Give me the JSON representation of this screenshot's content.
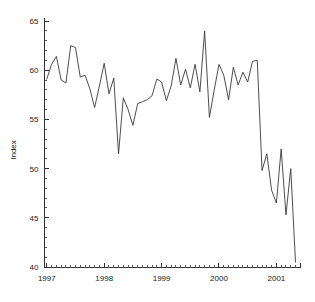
{
  "chart_data": {
    "type": "line",
    "title": "",
    "subtitle": "",
    "xlabel": "",
    "ylabel": "Index",
    "ylim": [
      40,
      65
    ],
    "xlim": [
      1996.96,
      2001.42
    ],
    "y_ticks": [
      40,
      45,
      50,
      55,
      60,
      65
    ],
    "y_tick_labels": [
      "40",
      "45",
      "50",
      "55",
      "60",
      "65"
    ],
    "y_minor_step": 1,
    "x_ticks": [
      1997,
      1998,
      1999,
      2000,
      2001
    ],
    "x_tick_labels": [
      "1997",
      "1998",
      "1999",
      "2000",
      "2001"
    ],
    "x_minor_step": 0.0833333,
    "grid": false,
    "legend": "none",
    "line_color": "#3a3a3a",
    "series": [
      {
        "name": "Index",
        "x": [
          1997.0,
          1997.083,
          1997.167,
          1997.25,
          1997.333,
          1997.417,
          1997.5,
          1997.583,
          1997.667,
          1997.75,
          1997.833,
          1997.917,
          1998.0,
          1998.083,
          1998.167,
          1998.25,
          1998.333,
          1998.417,
          1998.5,
          1998.583,
          1998.667,
          1998.75,
          1998.833,
          1998.917,
          1999.0,
          1999.083,
          1999.167,
          1999.25,
          1999.333,
          1999.417,
          1999.5,
          1999.583,
          1999.667,
          1999.75,
          1999.833,
          1999.917,
          2000.0,
          2000.083,
          2000.167,
          2000.25,
          2000.333,
          2000.417,
          2000.5,
          2000.583,
          2000.667,
          2000.75,
          2000.833,
          2000.917,
          2001.0,
          2001.083,
          2001.167,
          2001.25,
          2001.333
        ],
        "values": [
          59.1,
          60.6,
          61.4,
          59.0,
          58.7,
          62.5,
          62.3,
          59.3,
          59.5,
          58.1,
          56.2,
          58.4,
          60.7,
          57.6,
          59.2,
          51.5,
          57.2,
          56.0,
          54.4,
          56.6,
          56.8,
          57.0,
          57.4,
          59.1,
          58.8,
          56.9,
          58.4,
          61.2,
          58.5,
          60.1,
          58.2,
          60.6,
          57.8,
          64.0,
          55.2,
          58.0,
          60.6,
          59.5,
          57.0,
          60.3,
          58.5,
          59.8,
          58.8,
          60.9,
          61.0,
          49.8,
          51.5,
          47.8,
          46.5,
          52.0,
          45.3,
          50.0,
          40.5
        ]
      }
    ]
  },
  "axes": {
    "y_axis_title": "Index"
  }
}
